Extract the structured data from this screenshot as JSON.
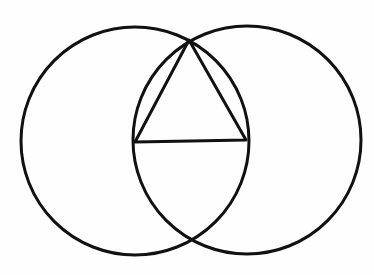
{
  "diagram": {
    "type": "geometric-construction",
    "title": "",
    "stroke_color": "#111111",
    "background_color": "#fefefe",
    "stroke_width": 3,
    "circles": [
      {
        "name": "left-circle",
        "cx": 135,
        "cy": 141,
        "r": 114
      },
      {
        "name": "right-circle",
        "cx": 247,
        "cy": 140,
        "r": 114
      }
    ],
    "triangle": {
      "name": "equilateral-triangle",
      "vertices": [
        {
          "label": "",
          "x": 189,
          "y": 40
        },
        {
          "label": "",
          "x": 135,
          "y": 142
        },
        {
          "label": "",
          "x": 246,
          "y": 140
        }
      ]
    },
    "intersections": [
      {
        "name": "top-intersection",
        "x": 189,
        "y": 40
      },
      {
        "name": "bottom-intersection",
        "x": 191,
        "y": 243
      }
    ]
  }
}
